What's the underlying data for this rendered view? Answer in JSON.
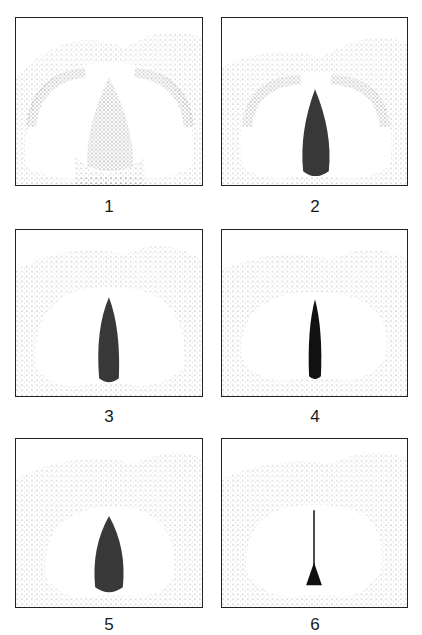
{
  "figure": {
    "panels": [
      {
        "label": "1",
        "glottis": "wide-triangular"
      },
      {
        "label": "2",
        "glottis": "narrow-triangular"
      },
      {
        "label": "3",
        "glottis": "narrow-oval"
      },
      {
        "label": "4",
        "glottis": "narrow-slit"
      },
      {
        "label": "5",
        "glottis": "elliptical"
      },
      {
        "label": "6",
        "glottis": "closed-posterior-chink"
      }
    ]
  }
}
